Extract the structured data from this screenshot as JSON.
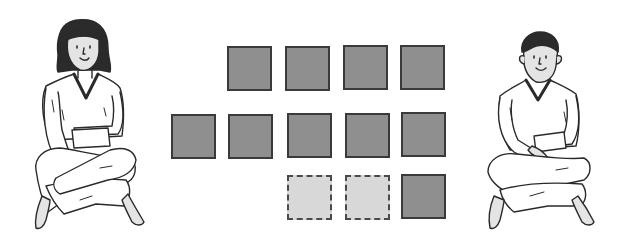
{
  "colors": {
    "solid_fill": "#8f8f8f",
    "solid_border": "#3a3a3a",
    "dashed_fill": "#d8d8d8",
    "dashed_border": "#4a4a4a",
    "line": "#2a2a2a",
    "skin": "#e4e4e4",
    "hair": "#2b2b2b"
  },
  "figures": [
    {
      "id": "girl",
      "description": "girl sitting cross-legged, pointing down"
    },
    {
      "id": "boy",
      "description": "boy sitting cross-legged, hands folded"
    }
  ],
  "squares": [
    {
      "row": 1,
      "x": 227,
      "y": 46,
      "style": "solid"
    },
    {
      "row": 1,
      "x": 285,
      "y": 46,
      "style": "solid"
    },
    {
      "row": 1,
      "x": 343,
      "y": 45,
      "style": "solid"
    },
    {
      "row": 1,
      "x": 400,
      "y": 45,
      "style": "solid"
    },
    {
      "row": 2,
      "x": 171,
      "y": 114,
      "style": "solid"
    },
    {
      "row": 2,
      "x": 228,
      "y": 114,
      "style": "solid"
    },
    {
      "row": 2,
      "x": 287,
      "y": 113,
      "style": "solid"
    },
    {
      "row": 2,
      "x": 345,
      "y": 113,
      "style": "solid"
    },
    {
      "row": 2,
      "x": 401,
      "y": 112,
      "style": "solid"
    },
    {
      "row": 3,
      "x": 287,
      "y": 175,
      "style": "dashed"
    },
    {
      "row": 3,
      "x": 345,
      "y": 175,
      "style": "dashed"
    },
    {
      "row": 3,
      "x": 401,
      "y": 174,
      "style": "solid"
    }
  ],
  "summary": {
    "solid_count": 10,
    "dashed_count": 2,
    "total": 12
  }
}
